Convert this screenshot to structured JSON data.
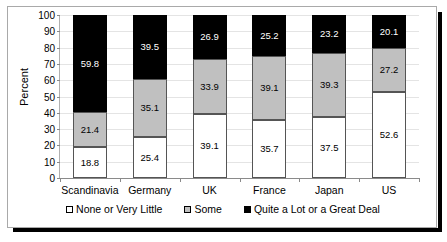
{
  "chart_data": {
    "type": "bar",
    "subtype": "stacked-100-percent",
    "title": "",
    "xlabel": "",
    "ylabel": "Percent",
    "ylim": [
      0,
      100
    ],
    "yticks": [
      0,
      10,
      20,
      30,
      40,
      50,
      60,
      70,
      80,
      90,
      100
    ],
    "grid": true,
    "legend_position": "bottom",
    "categories": [
      "Scandinavia",
      "Germany",
      "UK",
      "France",
      "Japan",
      "US"
    ],
    "series": [
      {
        "name": "None or Very Little",
        "color": "#ffffff",
        "label_color": "#000000",
        "values": [
          18.8,
          25.4,
          39.1,
          35.7,
          37.5,
          52.6
        ]
      },
      {
        "name": "Some",
        "color": "#c0c0c0",
        "label_color": "#000000",
        "values": [
          21.4,
          35.1,
          33.9,
          39.1,
          39.3,
          27.2
        ]
      },
      {
        "name": "Quite a Lot or a Great Deal",
        "color": "#000000",
        "label_color": "#ffffff",
        "values": [
          59.8,
          39.5,
          26.9,
          25.2,
          23.2,
          20.1
        ]
      }
    ]
  }
}
